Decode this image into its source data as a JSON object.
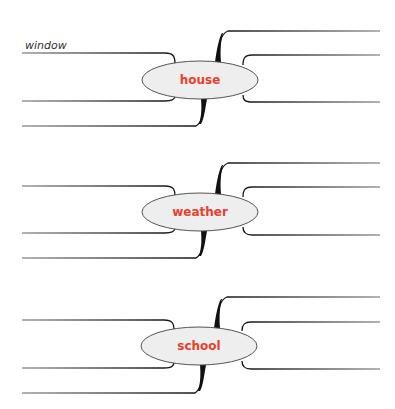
{
  "diagram": {
    "type": "mind-map-worksheet",
    "colors": {
      "label": "#e8402a",
      "ellipse_fill": "#eeeeee",
      "ellipse_stroke": "#555555",
      "line": "#111111",
      "handwritten": "#333333"
    },
    "nodes": [
      {
        "label": "house",
        "cx": 200,
        "cy": 80,
        "handwritten_branch_label": "window"
      },
      {
        "label": "weather",
        "cx": 200,
        "cy": 212,
        "handwritten_branch_label": ""
      },
      {
        "label": "school",
        "cx": 199,
        "cy": 346,
        "handwritten_branch_label": ""
      }
    ]
  }
}
